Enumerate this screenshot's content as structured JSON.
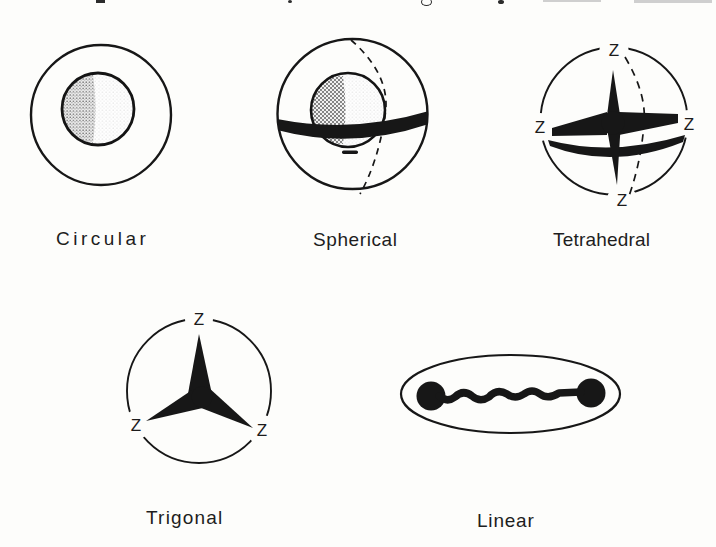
{
  "page": {
    "background_color": "#fdfdfb",
    "ink_color": "#171717",
    "shading": {
      "inner_sphere_light_region": "stipple",
      "inner_sphere_dark_region": "crosshatch"
    },
    "top_edge": {
      "clipped_text_line": true
    }
  },
  "figures": [
    {
      "id": "circular",
      "label": "Circular"
    },
    {
      "id": "spherical",
      "label": "Spherical"
    },
    {
      "id": "tetrahedral",
      "label": "Tetrahedral",
      "z_labels": {
        "top": "Z",
        "left": "Z",
        "right": "Z",
        "bottom": "Z"
      }
    },
    {
      "id": "trigonal",
      "label": "Trigonal",
      "z_labels": {
        "top": "Z",
        "lower_left": "Z",
        "lower_right": "Z"
      }
    },
    {
      "id": "linear",
      "label": "Linear"
    }
  ]
}
